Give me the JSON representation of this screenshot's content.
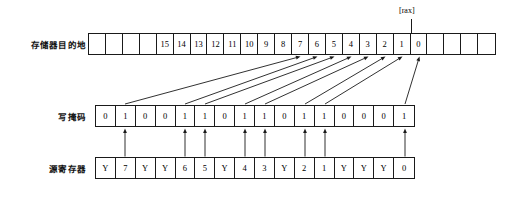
{
  "diagram": {
    "pointer_label": "[rax]",
    "ink_color": "#1a1a1a",
    "background_color": "#ffffff"
  },
  "rows": {
    "memory": {
      "label": "存储器目的地",
      "cell_count": 24,
      "cells": [
        "",
        "",
        "",
        "",
        "15",
        "14",
        "13",
        "12",
        "11",
        "10",
        "9",
        "8",
        "7",
        "6",
        "5",
        "4",
        "3",
        "2",
        "1",
        "0",
        "",
        "",
        "",
        ""
      ]
    },
    "mask": {
      "label": "写掩码",
      "cell_count": 16,
      "cells": [
        "0",
        "1",
        "0",
        "0",
        "1",
        "1",
        "0",
        "1",
        "1",
        "0",
        "1",
        "1",
        "0",
        "0",
        "0",
        "1"
      ]
    },
    "source": {
      "label": "源寄存器",
      "cell_count": 16,
      "cells": [
        "Y",
        "7",
        "Y",
        "Y",
        "6",
        "5",
        "Y",
        "4",
        "3",
        "Y",
        "2",
        "1",
        "Y",
        "Y",
        "Y",
        "0"
      ]
    }
  },
  "connections": {
    "vertical_arrows_from_source_to_mask": [
      1,
      4,
      5,
      7,
      8,
      10,
      11,
      15
    ],
    "diagonal_arrows_mask_index_to_memory_index": [
      {
        "mask": 1,
        "memory": 12
      },
      {
        "mask": 4,
        "memory": 13
      },
      {
        "mask": 5,
        "memory": 14
      },
      {
        "mask": 7,
        "memory": 15
      },
      {
        "mask": 8,
        "memory": 16
      },
      {
        "mask": 10,
        "memory": 17
      },
      {
        "mask": 11,
        "memory": 18
      },
      {
        "mask": 15,
        "memory": 19
      }
    ]
  },
  "pointer": {
    "label": "[rax]",
    "points_to_memory_boundary_after_cell": "0"
  }
}
